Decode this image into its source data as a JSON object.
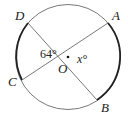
{
  "diagram": {
    "center_label": "O",
    "points": {
      "A": "A",
      "B": "B",
      "C": "C",
      "D": "D"
    },
    "angle_DOC": "64°",
    "angle_AOB": "x°",
    "colors": {
      "stroke": "#333333",
      "background": "#ffffff"
    }
  }
}
